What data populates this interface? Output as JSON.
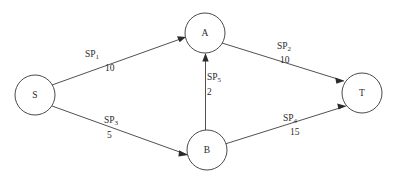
{
  "diagram": {
    "type": "directed-network-graph",
    "background_color": "#ffffff",
    "stroke_color": "#3d3d3d",
    "text_color": "#2b2b2b",
    "nodes": [
      {
        "id": "S",
        "label": "S",
        "cx": 35,
        "cy": 95,
        "r": 20
      },
      {
        "id": "A",
        "label": "A",
        "cx": 205,
        "cy": 33,
        "r": 20
      },
      {
        "id": "B",
        "label": "B",
        "cx": 207,
        "cy": 150,
        "r": 20
      },
      {
        "id": "T",
        "label": "T",
        "cx": 362,
        "cy": 93,
        "r": 20
      }
    ],
    "edges": [
      {
        "id": "e1",
        "from": "S",
        "to": "A",
        "name": "SP",
        "subscript": "1",
        "weight": "10",
        "name_x": 85,
        "name_y": 50,
        "weight_x": 105,
        "weight_y": 64
      },
      {
        "id": "e2",
        "from": "A",
        "to": "T",
        "name": "SP",
        "subscript": "2",
        "weight": "10",
        "name_x": 277,
        "name_y": 42,
        "weight_x": 280,
        "weight_y": 56
      },
      {
        "id": "e3",
        "from": "S",
        "to": "B",
        "name": "SP",
        "subscript": "3",
        "weight": "5",
        "name_x": 104,
        "name_y": 116,
        "weight_x": 107,
        "weight_y": 131
      },
      {
        "id": "e4",
        "from": "B",
        "to": "T",
        "name": "SP",
        "subscript": "4",
        "weight": "15",
        "name_x": 283,
        "name_y": 114,
        "weight_x": 290,
        "weight_y": 128
      },
      {
        "id": "e5",
        "from": "B",
        "to": "A",
        "name": "SP",
        "subscript": "5",
        "weight": "2",
        "name_x": 207,
        "name_y": 73,
        "weight_x": 207,
        "weight_y": 88
      }
    ]
  }
}
